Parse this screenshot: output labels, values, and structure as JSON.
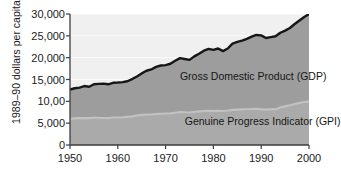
{
  "chart_data": {
    "type": "area",
    "title": "",
    "xlabel": "",
    "ylabel": "1989–90 dollars per capita",
    "xlim": [
      1950,
      2000
    ],
    "ylim": [
      0,
      30000
    ],
    "grid": true,
    "legend_position": "inline-annotation",
    "x_ticks": [
      "1950",
      "1960",
      "1970",
      "1980",
      "1990",
      "2000"
    ],
    "x_tick_values": [
      1950,
      1960,
      1970,
      1980,
      1990,
      2000
    ],
    "y_ticks": [
      "0",
      "5,000",
      "10,00",
      "15,000",
      "20,000",
      "25,000",
      "30,000"
    ],
    "y_tick_values": [
      0,
      5000,
      10000,
      15000,
      20000,
      25000,
      30000
    ],
    "x": [
      1950,
      1951,
      1952,
      1953,
      1954,
      1955,
      1956,
      1957,
      1958,
      1959,
      1960,
      1961,
      1962,
      1963,
      1964,
      1965,
      1966,
      1967,
      1968,
      1969,
      1970,
      1971,
      1972,
      1973,
      1974,
      1975,
      1976,
      1977,
      1978,
      1979,
      1980,
      1981,
      1982,
      1983,
      1984,
      1985,
      1986,
      1987,
      1988,
      1989,
      1990,
      1991,
      1992,
      1993,
      1994,
      1995,
      1996,
      1997,
      1998,
      1999,
      2000
    ],
    "series": [
      {
        "name": "Gross Domestic Product (GDP)",
        "label": "Gross Domestic Product (GDP)",
        "color": "#1a1a1a",
        "fill_color": "#9e9e9e",
        "values": [
          12700,
          13000,
          13150,
          13500,
          13350,
          13900,
          14000,
          14050,
          13900,
          14250,
          14300,
          14400,
          14600,
          15100,
          15700,
          16400,
          17000,
          17300,
          17900,
          18200,
          18300,
          18600,
          19300,
          19900,
          19700,
          19500,
          20300,
          20900,
          21600,
          22000,
          21800,
          22100,
          21500,
          22100,
          23200,
          23600,
          23900,
          24300,
          24800,
          25200,
          25100,
          24500,
          24700,
          24900,
          25700,
          26200,
          26800,
          27700,
          28500,
          29300,
          30000
        ]
      },
      {
        "name": "Genuine Progress Indicator (GPI)",
        "label": "Genuine Progress Indicator (GPI)",
        "color": "#b3b3b3",
        "fill_color": "#a8a8a8",
        "values": [
          6000,
          6100,
          6150,
          6200,
          6150,
          6250,
          6250,
          6200,
          6150,
          6300,
          6300,
          6350,
          6450,
          6550,
          6750,
          6900,
          7000,
          7000,
          7100,
          7150,
          7200,
          7250,
          7400,
          7550,
          7500,
          7450,
          7600,
          7700,
          7800,
          7850,
          7800,
          7850,
          7800,
          7900,
          8050,
          8100,
          8150,
          8200,
          8250,
          8300,
          8200,
          8100,
          8150,
          8200,
          8600,
          8850,
          9100,
          9400,
          9650,
          9850,
          10000
        ]
      }
    ],
    "annotations": [
      {
        "text": "Gross Domestic Product (GDP)",
        "x": 1973,
        "y": 15500
      },
      {
        "text": "Genuine Progress Indicator (GPI)",
        "x": 1974,
        "y": 5200
      }
    ]
  },
  "colors": {
    "background_upper": "#f0f0f0",
    "gdp_fill": "#9d9d9d",
    "gpi_fill": "#aaaaaa",
    "gdp_line": "#161616",
    "gpi_line": "#b8b8b8",
    "axis": "#3d3d3d",
    "gridline": "#ffffff",
    "text": "#1b1b1b"
  },
  "labels": {
    "gdp_annotation": "Gross Domestic Product (GDP)",
    "gpi_annotation": "Genuine Progress Indicator (GPI)"
  }
}
